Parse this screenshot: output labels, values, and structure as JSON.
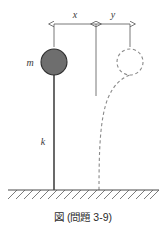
{
  "figure": {
    "caption": "図 (問題 3-9)",
    "labels": {
      "mass": "m",
      "spring": "k",
      "dim_x": "x",
      "dim_y": "y"
    },
    "colors": {
      "mass_fill": "#6e6e6e",
      "mass_stroke": "#2e2e2e",
      "ghost_stroke": "#8a8a8a",
      "rod": "#1a1a1a",
      "ground": "#4a4a4a",
      "dimension": "#555555",
      "text": "#2b2b2b",
      "background": "#ffffff"
    },
    "geometry": {
      "mass_center_x": 54,
      "mass_center_y": 62,
      "mass_radius": 13,
      "ghost_center_x": 130,
      "ghost_center_y": 62,
      "ghost_radius": 13,
      "rod_x": 54,
      "rod_top_y": 75,
      "rod_bottom_y": 190,
      "ground_y": 190,
      "ground_left_x": 8,
      "ground_right_x": 159,
      "dim_line_y": 24,
      "ext_left_x": 54,
      "ext_mid_x": 96,
      "ext_right_x": 130
    }
  }
}
